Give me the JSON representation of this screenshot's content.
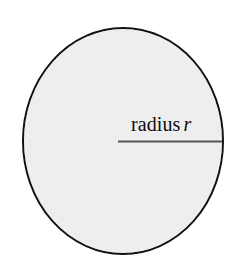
{
  "figure": {
    "kind": "geometry-diagram",
    "canvas": {
      "width": 242,
      "height": 267
    },
    "background_color": "#ffffff",
    "shape": {
      "name": "circle",
      "fill_color": "#f1f1f1",
      "stroke_color": "#111111",
      "stroke_width": 2,
      "center_x": 123,
      "center_y": 141,
      "radius_x": 100,
      "radius_y": 113
    },
    "radius_segment": {
      "name": "radius-line",
      "color": "#555555",
      "width": 2,
      "x1": 118,
      "y1": 141,
      "x2": 222,
      "y2": 141
    },
    "label": {
      "text": "radius",
      "variable": "r",
      "full_text": "radius r",
      "color": "#0d0d0d",
      "font_size": 20
    }
  }
}
